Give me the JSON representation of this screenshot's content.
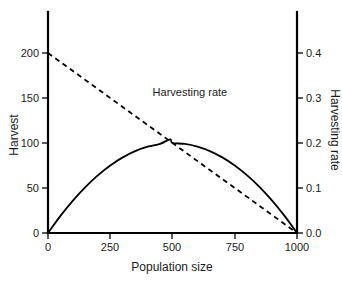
{
  "chart_data": {
    "type": "line",
    "title": "",
    "subtitle": "",
    "xlabel": "Population size",
    "ylabel": "Harvest",
    "y2label": "Harvesting rate",
    "xlim": [
      0,
      1000
    ],
    "ylim": [
      0,
      215
    ],
    "y2lim": [
      0,
      0.43
    ],
    "grid": false,
    "legend_position": "inline-annotation",
    "xticks": [
      0,
      250,
      500,
      750,
      1000
    ],
    "xticklabels": [
      "0",
      "250",
      "500",
      "750",
      "1000"
    ],
    "yticks": [
      0,
      50,
      100,
      150,
      200
    ],
    "yticklabels": [
      "0",
      "50",
      "100",
      "150",
      "200"
    ],
    "y2ticks": [
      0.0,
      0.1,
      0.2,
      0.3,
      0.4
    ],
    "y2ticklabels": [
      "0.0",
      "0.1",
      "0.2",
      "0.3",
      "0.4"
    ],
    "annotations": [
      {
        "text": "Harvesting rate",
        "x": 420,
        "y": 152,
        "series": "harvesting-rate"
      }
    ],
    "series": [
      {
        "name": "Harvest",
        "axis": "left",
        "style": "solid",
        "x": [
          0,
          50,
          100,
          150,
          200,
          250,
          300,
          350,
          400,
          450,
          490,
          500,
          550,
          600,
          650,
          700,
          750,
          800,
          850,
          900,
          950,
          1000
        ],
        "values": [
          0,
          19,
          36,
          51,
          64,
          75,
          84,
          91,
          96,
          99,
          104,
          100,
          99,
          96,
          91,
          84,
          75,
          64,
          51,
          36,
          19,
          0
        ]
      },
      {
        "name": "Harvesting rate",
        "axis": "right",
        "style": "dashed",
        "x": [
          0,
          1000
        ],
        "values": [
          0.4,
          0.0
        ]
      }
    ]
  },
  "figure": {
    "background_color": "#ffffff",
    "line_color": "#000000",
    "text_color": "#1a1a1a"
  }
}
